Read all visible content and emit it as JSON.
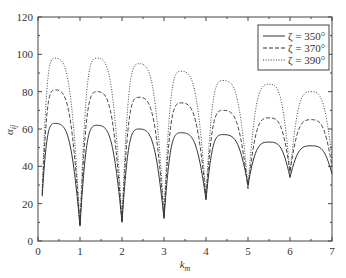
{
  "chart_data": {
    "type": "line",
    "title": "",
    "xlabel": "k_m",
    "ylabel": "α_ij",
    "xlim": [
      0,
      7
    ],
    "ylim": [
      0,
      120
    ],
    "xticks": [
      0,
      1,
      2,
      3,
      4,
      5,
      6,
      7
    ],
    "yticks": [
      0,
      20,
      40,
      60,
      80,
      100,
      120
    ],
    "grid": false,
    "legend_position": "upper right",
    "x": [
      0.1,
      0.4,
      1.0,
      1.4,
      2.0,
      2.4,
      3.0,
      3.4,
      4.0,
      4.4,
      5.0,
      5.5,
      6.0,
      6.5,
      7.0
    ],
    "series": [
      {
        "name": "ζ = 350°",
        "style": "solid",
        "values": [
          24,
          63,
          8,
          62,
          10,
          60,
          12,
          58,
          22,
          57,
          30,
          53,
          34,
          51,
          36
        ]
      },
      {
        "name": "ζ = 370°",
        "style": "dashed",
        "values": [
          25,
          81,
          8,
          80,
          10,
          77,
          13,
          74,
          23,
          70,
          28,
          66,
          37,
          65,
          40
        ]
      },
      {
        "name": "ζ = 390°",
        "style": "dotted",
        "values": [
          27,
          98,
          9,
          98,
          11,
          95,
          14,
          91,
          24,
          86,
          29,
          84,
          36,
          80,
          44
        ]
      }
    ]
  },
  "axes": {
    "xlabel_main": "k",
    "xlabel_sub": "m",
    "ylabel_main": "α",
    "ylabel_sub": "ij"
  },
  "legend": {
    "items": [
      {
        "label": "ζ = 350°"
      },
      {
        "label": "ζ = 370°"
      },
      {
        "label": "ζ = 390°"
      }
    ]
  }
}
